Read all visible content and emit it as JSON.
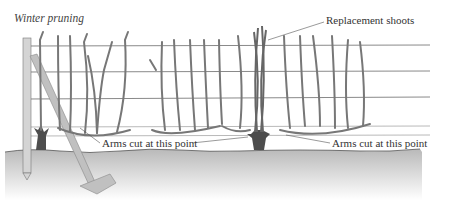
{
  "title": "Winter pruning",
  "labels": {
    "replacement_shoots": "Replacement shoots",
    "arms_cut_left": "Arms cut at this point",
    "arms_cut_right": "Arms cut at this point"
  },
  "colors": {
    "vine": "#7a7a7a",
    "vine_dark": "#5a5a5a",
    "wire": "#8a8a8a",
    "post": "#cfcfcf",
    "ground": "#c8c8c8",
    "spade": "#bdbdbd"
  }
}
